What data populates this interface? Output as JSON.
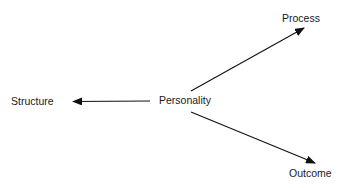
{
  "diagram": {
    "center": {
      "label": "Personality"
    },
    "nodes": [
      {
        "id": "process",
        "label": "Process"
      },
      {
        "id": "structure",
        "label": "Structure"
      },
      {
        "id": "outcome",
        "label": "Outcome"
      }
    ],
    "edges": [
      {
        "from": "Personality",
        "to": "Process"
      },
      {
        "from": "Personality",
        "to": "Structure"
      },
      {
        "from": "Personality",
        "to": "Outcome"
      }
    ],
    "colors": {
      "line": "#111111",
      "text": "#1a1a1a",
      "background": "#ffffff"
    }
  }
}
